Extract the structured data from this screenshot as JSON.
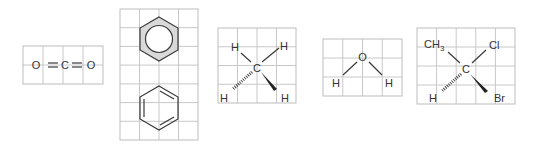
{
  "molecules": {
    "co2": {
      "name": "carbon dioxide",
      "atoms": {
        "o1": "O",
        "c": "C",
        "o2": "O"
      },
      "grid": {
        "x": 23,
        "y": 46,
        "cols": 4,
        "rows": 2,
        "cell_w": 20,
        "cell_h": 19
      }
    },
    "benzene": {
      "name": "benzene",
      "styles": [
        "aromatic circle (shaded)",
        "Kekulé structure"
      ],
      "grid": {
        "x": 120,
        "y": 9,
        "cols": 4,
        "rows": 7,
        "cell_w": 19.5,
        "cell_h": 18.7
      },
      "shade_color": "#d9d9d9"
    },
    "methane": {
      "name": "methane (wedge-dash)",
      "atoms": {
        "h_top_left": "H",
        "h_top_right": "H",
        "c": "C",
        "h_bottom_left": "H",
        "h_bottom_right": "H"
      },
      "grid": {
        "x": 218,
        "y": 28,
        "cols": 4,
        "rows": 4,
        "cell_w": 19.5,
        "cell_h": 18.75
      }
    },
    "water": {
      "name": "water",
      "atoms": {
        "o": "O",
        "h_left": "H",
        "h_right": "H"
      },
      "grid": {
        "x": 323,
        "y": 39,
        "cols": 4,
        "rows": 3,
        "cell_w": 19.75,
        "cell_h": 19
      }
    },
    "bromochloroethane": {
      "name": "chiral carbon (wedge-dash)",
      "atoms": {
        "ch3": "CH",
        "ch3_sub": "3",
        "cl": "Cl",
        "c": "C",
        "h": "H",
        "br": "Br"
      },
      "grid": {
        "x": 417,
        "y": 28,
        "cols": 5,
        "rows": 4,
        "cell_w": 19.6,
        "cell_h": 19
      }
    }
  },
  "colors": {
    "grid": "#c8c8c8",
    "bond": "#3a3a3a",
    "text": "#333333",
    "background": "#ffffff"
  }
}
